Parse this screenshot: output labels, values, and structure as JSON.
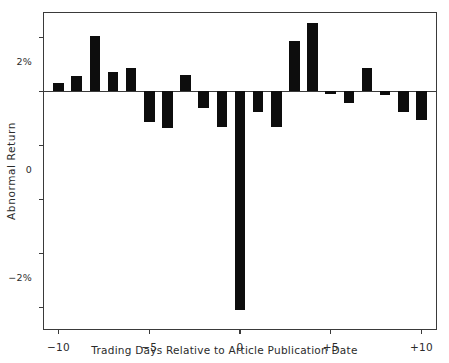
{
  "chart_data": {
    "type": "bar",
    "title": "",
    "subtitle": "",
    "xlabel": "Trading Days Relative to Article Publication Date",
    "ylabel": "Abnormal Return",
    "grid": false,
    "legend": null,
    "xlim": [
      -10.8,
      10.8
    ],
    "ylim": [
      -8.8,
      2.9
    ],
    "x_tick_values": [
      -10,
      -5,
      0,
      5,
      10
    ],
    "x_tick_labels": [
      "−10",
      "−5",
      "0",
      "+5",
      "+10"
    ],
    "y_tick_values": [
      2,
      0,
      -2,
      -4,
      -6,
      -8
    ],
    "y_tick_labels": [
      "2%",
      "0",
      "−2%",
      "−4%",
      "−6%",
      "−8%"
    ],
    "bar_color": "#0d0d0d",
    "axis_color": "#3a3a3a",
    "categories": [
      -10,
      -9,
      -8,
      -7,
      -6,
      -5,
      -4,
      -3,
      -2,
      -1,
      0,
      1,
      2,
      3,
      4,
      5,
      6,
      7,
      8,
      9,
      10
    ],
    "values": [
      0.32,
      0.55,
      2.06,
      0.7,
      0.88,
      -1.12,
      -1.35,
      0.62,
      -0.63,
      -1.33,
      -8.1,
      -0.75,
      -1.33,
      1.88,
      2.52,
      -0.1,
      -0.42,
      0.85,
      -0.12,
      -0.78,
      -1.05
    ],
    "units": "percent"
  }
}
